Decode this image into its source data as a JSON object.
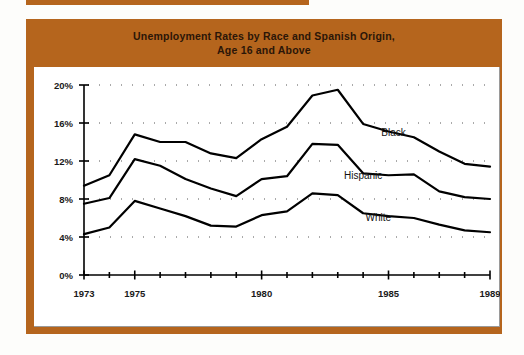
{
  "figure": {
    "title": "Unemployment Rates by Race and Spanish Origin,\nAge 16 and Above",
    "frame_color": "#b5651d",
    "title_color": "#2b1608"
  },
  "chart_data": {
    "type": "line",
    "title": "Unemployment Rates by Race and Spanish Origin, Age 16 and Above",
    "xlabel": "",
    "ylabel": "",
    "xlim": [
      1973,
      1989
    ],
    "ylim": [
      0,
      20
    ],
    "grid": "dotted-horizontal",
    "legend": "inline-labels",
    "x": [
      1973,
      1974,
      1975,
      1976,
      1977,
      1978,
      1979,
      1980,
      1981,
      1982,
      1983,
      1984,
      1985,
      1986,
      1987,
      1988,
      1989
    ],
    "xtick_labels": [
      "1973",
      "1975",
      "1980",
      "1985",
      "1989"
    ],
    "xtick_values": [
      1973,
      1975,
      1980,
      1985,
      1989
    ],
    "ytick_labels": [
      "0%",
      "4%",
      "8%",
      "12%",
      "16%",
      "20%"
    ],
    "ytick_values": [
      0,
      4,
      8,
      12,
      16,
      20
    ],
    "series": [
      {
        "name": "Black",
        "label": "Black",
        "color": "#000000",
        "values": [
          9.4,
          10.5,
          14.8,
          14.0,
          14.0,
          12.8,
          12.3,
          14.3,
          15.6,
          18.9,
          19.5,
          15.9,
          15.1,
          14.5,
          13.0,
          11.7,
          11.4
        ]
      },
      {
        "name": "Hispanic",
        "label": "Hispanic",
        "color": "#000000",
        "values": [
          7.5,
          8.1,
          12.2,
          11.5,
          10.1,
          9.1,
          8.3,
          10.1,
          10.4,
          13.8,
          13.7,
          10.7,
          10.5,
          10.6,
          8.8,
          8.2,
          8.0
        ]
      },
      {
        "name": "White",
        "label": "White",
        "color": "#000000",
        "values": [
          4.3,
          5.0,
          7.8,
          7.0,
          6.2,
          5.2,
          5.1,
          6.3,
          6.7,
          8.6,
          8.4,
          6.5,
          6.2,
          6.0,
          5.3,
          4.7,
          4.5
        ]
      }
    ],
    "series_label_positions": [
      {
        "name": "Black",
        "x": 1985.2,
        "y": 14.6
      },
      {
        "name": "Hispanic",
        "x": 1984.0,
        "y": 10.1
      },
      {
        "name": "White",
        "x": 1984.6,
        "y": 5.7
      }
    ]
  }
}
